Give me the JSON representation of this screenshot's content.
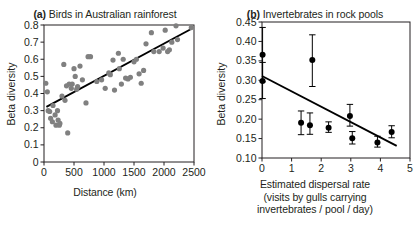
{
  "figure": {
    "background": "#ffffff",
    "ink": "#231f20",
    "panels": [
      "a",
      "b"
    ]
  },
  "chart_data": [
    {
      "type": "scatter",
      "panel": "a",
      "tag": "(a)",
      "title": "Birds in Australian rainforest",
      "xlabel": "Distance (km)",
      "ylabel": "Beta diversity",
      "xlim": [
        0,
        2500
      ],
      "ylim": [
        0,
        0.8
      ],
      "xticks": [
        0,
        500,
        1000,
        1500,
        2000,
        2500
      ],
      "xticklabels": [
        "0",
        "500",
        "1000",
        "1500",
        "2000",
        "2500"
      ],
      "yticks": [
        0,
        0.1,
        0.2,
        0.3,
        0.4,
        0.5,
        0.6,
        0.7,
        0.8
      ],
      "yticklabels": [
        "0",
        "0.1",
        "0.2",
        "0.3",
        "0.4",
        "0.5",
        "0.6",
        "0.7",
        "0.8"
      ],
      "grid": false,
      "legend": "none",
      "marker_color": "#808080",
      "marker_radius": 2.6,
      "line_color": "#000000",
      "trendline": {
        "x": [
          40,
          2460
        ],
        "y": [
          0.322,
          0.778
        ],
        "slope": 0.000188,
        "intercept": 0.3145
      },
      "points": [
        {
          "x": 30,
          "y": 0.46
        },
        {
          "x": 55,
          "y": 0.41
        },
        {
          "x": 70,
          "y": 0.3
        },
        {
          "x": 95,
          "y": 0.295
        },
        {
          "x": 110,
          "y": 0.255
        },
        {
          "x": 140,
          "y": 0.235
        },
        {
          "x": 150,
          "y": 0.33
        },
        {
          "x": 185,
          "y": 0.275
        },
        {
          "x": 200,
          "y": 0.215
        },
        {
          "x": 225,
          "y": 0.3
        },
        {
          "x": 235,
          "y": 0.245
        },
        {
          "x": 255,
          "y": 0.215
        },
        {
          "x": 265,
          "y": 0.225
        },
        {
          "x": 300,
          "y": 0.385
        },
        {
          "x": 330,
          "y": 0.57
        },
        {
          "x": 350,
          "y": 0.36
        },
        {
          "x": 375,
          "y": 0.445
        },
        {
          "x": 395,
          "y": 0.17
        },
        {
          "x": 420,
          "y": 0.455
        },
        {
          "x": 455,
          "y": 0.43
        },
        {
          "x": 470,
          "y": 0.455
        },
        {
          "x": 500,
          "y": 0.545
        },
        {
          "x": 520,
          "y": 0.5
        },
        {
          "x": 545,
          "y": 0.425
        },
        {
          "x": 560,
          "y": 0.44
        },
        {
          "x": 600,
          "y": 0.56
        },
        {
          "x": 640,
          "y": 0.48
        },
        {
          "x": 700,
          "y": 0.345
        },
        {
          "x": 735,
          "y": 0.615
        },
        {
          "x": 775,
          "y": 0.615
        },
        {
          "x": 880,
          "y": 0.47
        },
        {
          "x": 960,
          "y": 0.48
        },
        {
          "x": 1020,
          "y": 0.43
        },
        {
          "x": 1080,
          "y": 0.52
        },
        {
          "x": 1105,
          "y": 0.51
        },
        {
          "x": 1150,
          "y": 0.595
        },
        {
          "x": 1175,
          "y": 0.42
        },
        {
          "x": 1240,
          "y": 0.635
        },
        {
          "x": 1255,
          "y": 0.545
        },
        {
          "x": 1290,
          "y": 0.455
        },
        {
          "x": 1320,
          "y": 0.6
        },
        {
          "x": 1360,
          "y": 0.49
        },
        {
          "x": 1400,
          "y": 0.485
        },
        {
          "x": 1440,
          "y": 0.495
        },
        {
          "x": 1500,
          "y": 0.585
        },
        {
          "x": 1540,
          "y": 0.6
        },
        {
          "x": 1585,
          "y": 0.515
        },
        {
          "x": 1620,
          "y": 0.46
        },
        {
          "x": 1660,
          "y": 0.535
        },
        {
          "x": 1700,
          "y": 0.69
        },
        {
          "x": 1790,
          "y": 0.755
        },
        {
          "x": 1830,
          "y": 0.645
        },
        {
          "x": 1920,
          "y": 0.645
        },
        {
          "x": 1985,
          "y": 0.665
        },
        {
          "x": 2020,
          "y": 0.77
        },
        {
          "x": 2060,
          "y": 0.645
        },
        {
          "x": 2090,
          "y": 0.655
        },
        {
          "x": 2130,
          "y": 0.7
        },
        {
          "x": 2200,
          "y": 0.795
        },
        {
          "x": 2225,
          "y": 0.715
        },
        {
          "x": 2455,
          "y": 0.785
        }
      ]
    },
    {
      "type": "scatter",
      "panel": "b",
      "tag": "(b)",
      "title": "Invertebrates in rock pools",
      "xlabel_lines": [
        "Estimated dispersal rate",
        "(visits by gulls carrying",
        "invertebrates / pool / day)"
      ],
      "ylabel": "Beta diversity",
      "xlim": [
        0,
        5
      ],
      "ylim": [
        0.1,
        0.45
      ],
      "xticks": [
        0,
        1,
        2,
        3,
        4,
        5
      ],
      "xticklabels": [
        "0",
        "1",
        "2",
        "3",
        "4",
        "5"
      ],
      "yticks": [
        0.1,
        0.15,
        0.2,
        0.25,
        0.3,
        0.35,
        0.4,
        0.45
      ],
      "yticklabels": [
        "0.10",
        "0.15",
        "0.20",
        "0.25",
        "0.30",
        "0.35",
        "0.40",
        "0.45"
      ],
      "grid": false,
      "legend": "none",
      "marker_color": "#000000",
      "marker_radius": 3.0,
      "line_color": "#000000",
      "errorbars": true,
      "trendline": {
        "x": [
          0.0,
          4.55
        ],
        "y": [
          0.311,
          0.131
        ],
        "slope": -0.0396,
        "intercept": 0.311
      },
      "points": [
        {
          "x": 0.02,
          "y": 0.366,
          "yerr_low": 0.296,
          "yerr_high": 0.436
        },
        {
          "x": 0.02,
          "y": 0.298,
          "yerr_low": 0.253,
          "yerr_high": 0.346
        },
        {
          "x": 1.32,
          "y": 0.191,
          "yerr_low": 0.16,
          "yerr_high": 0.221
        },
        {
          "x": 1.62,
          "y": 0.184,
          "yerr_low": 0.161,
          "yerr_high": 0.216
        },
        {
          "x": 1.7,
          "y": 0.352,
          "yerr_low": 0.284,
          "yerr_high": 0.417
        },
        {
          "x": 2.25,
          "y": 0.178,
          "yerr_low": 0.166,
          "yerr_high": 0.193
        },
        {
          "x": 2.97,
          "y": 0.208,
          "yerr_low": 0.182,
          "yerr_high": 0.238
        },
        {
          "x": 3.05,
          "y": 0.151,
          "yerr_low": 0.136,
          "yerr_high": 0.168
        },
        {
          "x": 3.9,
          "y": 0.14,
          "yerr_low": 0.128,
          "yerr_high": 0.156
        },
        {
          "x": 4.38,
          "y": 0.167,
          "yerr_low": 0.152,
          "yerr_high": 0.183
        }
      ]
    }
  ]
}
